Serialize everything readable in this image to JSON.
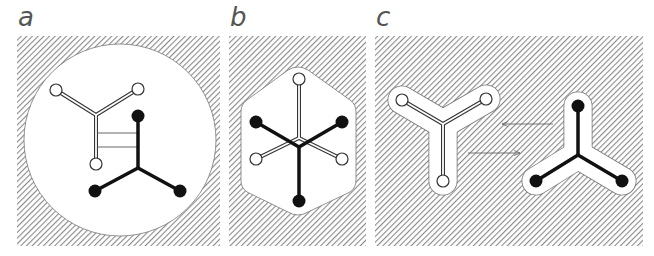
{
  "figure": {
    "panels": [
      {
        "id": "a",
        "label": "a",
        "description": "Two Y-shaped molecules (one hollow, one solid) inside a large circular cavity, connected by two parallel bridge lines"
      },
      {
        "id": "b",
        "label": "b",
        "description": "Hollow and solid Y-shaped molecules overlapped inside a rounded hexagonal cavity"
      },
      {
        "id": "c",
        "label": "c",
        "description": "Hollow and solid Y-shaped molecules each in their own fitted Y-shaped cavity, with arrows pointing between them"
      }
    ],
    "colors": {
      "hatch": "#888888",
      "background": "#ffffff",
      "solid_molecule": "#111111",
      "hollow_molecule_outline": "#333333",
      "label": "#555555"
    },
    "arrows": [
      {
        "direction": "left",
        "panel": "c"
      },
      {
        "direction": "right",
        "panel": "c"
      }
    ]
  }
}
